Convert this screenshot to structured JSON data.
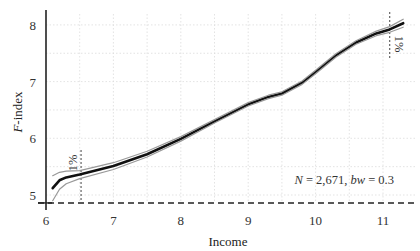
{
  "chart_data": {
    "type": "line",
    "title": "",
    "xlabel": "Income",
    "ylabel": "F-index",
    "ylabel_italic_part": "F",
    "ylabel_rest": "-index",
    "xlim": [
      6.0,
      11.35
    ],
    "ylim": [
      4.78,
      8.3
    ],
    "xticks": [
      6,
      7,
      8,
      9,
      10,
      11
    ],
    "yticks": [
      5,
      6,
      7,
      8
    ],
    "grid": true,
    "legend": null,
    "annotation": {
      "N_label": "N",
      "N_value": " = 2,671, ",
      "bw_label": "bw",
      "bw_value": " = 0.3",
      "full_text": "N = 2,671, bw = 0.3"
    },
    "percentile_markers": [
      {
        "x": 6.52,
        "label": "1%",
        "side": "low"
      },
      {
        "x": 11.1,
        "label": "1%",
        "side": "high"
      }
    ],
    "baseline": {
      "y": 4.86,
      "style": "dashed"
    },
    "series": [
      {
        "name": "estimate",
        "x": [
          6.1,
          6.2,
          6.3,
          6.5,
          7.0,
          7.5,
          8.0,
          8.5,
          9.0,
          9.3,
          9.5,
          9.8,
          10.0,
          10.3,
          10.6,
          10.9,
          11.1,
          11.3
        ],
        "y": [
          5.12,
          5.26,
          5.31,
          5.36,
          5.51,
          5.72,
          5.99,
          6.3,
          6.6,
          6.73,
          6.79,
          6.98,
          7.17,
          7.46,
          7.69,
          7.85,
          7.92,
          8.03
        ]
      },
      {
        "name": "ci_upper",
        "x": [
          6.1,
          6.2,
          6.3,
          6.5,
          7.0,
          7.5,
          8.0,
          8.5,
          9.0,
          9.3,
          9.5,
          9.8,
          10.0,
          10.3,
          10.6,
          10.9,
          11.1,
          11.3
        ],
        "y": [
          5.34,
          5.4,
          5.42,
          5.43,
          5.57,
          5.77,
          6.03,
          6.33,
          6.63,
          6.76,
          6.82,
          7.01,
          7.2,
          7.49,
          7.72,
          7.89,
          7.97,
          8.1
        ]
      },
      {
        "name": "ci_lower",
        "x": [
          6.1,
          6.2,
          6.3,
          6.5,
          7.0,
          7.5,
          8.0,
          8.5,
          9.0,
          9.3,
          9.5,
          9.8,
          10.0,
          10.3,
          10.6,
          10.9,
          11.1,
          11.3
        ],
        "y": [
          4.9,
          5.1,
          5.2,
          5.29,
          5.45,
          5.67,
          5.95,
          6.27,
          6.57,
          6.7,
          6.76,
          6.95,
          7.14,
          7.43,
          7.66,
          7.81,
          7.87,
          7.96
        ]
      }
    ]
  }
}
